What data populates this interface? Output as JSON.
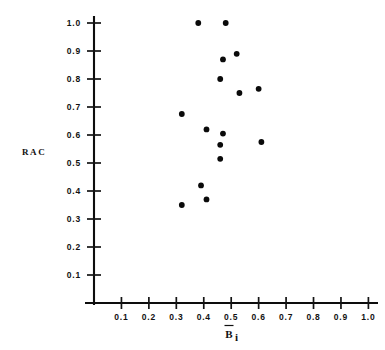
{
  "figure": {
    "background_color": "#ffffff",
    "ink_color": "#0a0a0a"
  },
  "chart_data": {
    "type": "scatter",
    "title": "",
    "subtitle": "",
    "xlabel": "B̄i",
    "xlabel_base": "B",
    "xlabel_sub": "i",
    "ylabel": "RAC",
    "xlim": [
      0.0,
      1.05
    ],
    "ylim": [
      0.0,
      1.03
    ],
    "grid": false,
    "legend": null,
    "legend_position": "none",
    "marker": "filled-circle",
    "marker_color": "#0a0a0a",
    "xticks": [
      0.1,
      0.2,
      0.3,
      0.4,
      0.5,
      0.6,
      0.7,
      0.8,
      0.9,
      1.0
    ],
    "xtick_labels": [
      "0.1",
      "0.2",
      "0.3",
      "0.4",
      "0.5",
      "0.6",
      "0.7",
      "0.8",
      "0.9",
      "1.0"
    ],
    "yticks": [
      0.1,
      0.2,
      0.3,
      0.4,
      0.5,
      0.6,
      0.7,
      0.8,
      0.9,
      1.0
    ],
    "ytick_labels": [
      "0.1",
      "0.2",
      "0.3",
      "0.4",
      "0.5",
      "0.6",
      "0.7",
      "0.8",
      "0.9",
      "1.0"
    ],
    "x": [
      0.38,
      0.48,
      0.47,
      0.52,
      0.46,
      0.53,
      0.6,
      0.32,
      0.41,
      0.47,
      0.46,
      0.61,
      0.46,
      0.39,
      0.41,
      0.32
    ],
    "y": [
      1.0,
      1.0,
      0.87,
      0.89,
      0.8,
      0.75,
      0.765,
      0.675,
      0.62,
      0.605,
      0.565,
      0.575,
      0.515,
      0.42,
      0.37,
      0.35
    ],
    "points": [
      {
        "x": 0.38,
        "y": 1.0
      },
      {
        "x": 0.48,
        "y": 1.0
      },
      {
        "x": 0.47,
        "y": 0.87
      },
      {
        "x": 0.52,
        "y": 0.89
      },
      {
        "x": 0.46,
        "y": 0.8
      },
      {
        "x": 0.53,
        "y": 0.75
      },
      {
        "x": 0.6,
        "y": 0.765
      },
      {
        "x": 0.32,
        "y": 0.675
      },
      {
        "x": 0.41,
        "y": 0.62
      },
      {
        "x": 0.47,
        "y": 0.605
      },
      {
        "x": 0.46,
        "y": 0.565
      },
      {
        "x": 0.61,
        "y": 0.575
      },
      {
        "x": 0.46,
        "y": 0.515
      },
      {
        "x": 0.39,
        "y": 0.42
      },
      {
        "x": 0.41,
        "y": 0.37
      },
      {
        "x": 0.32,
        "y": 0.35
      }
    ],
    "n_points": 16
  }
}
